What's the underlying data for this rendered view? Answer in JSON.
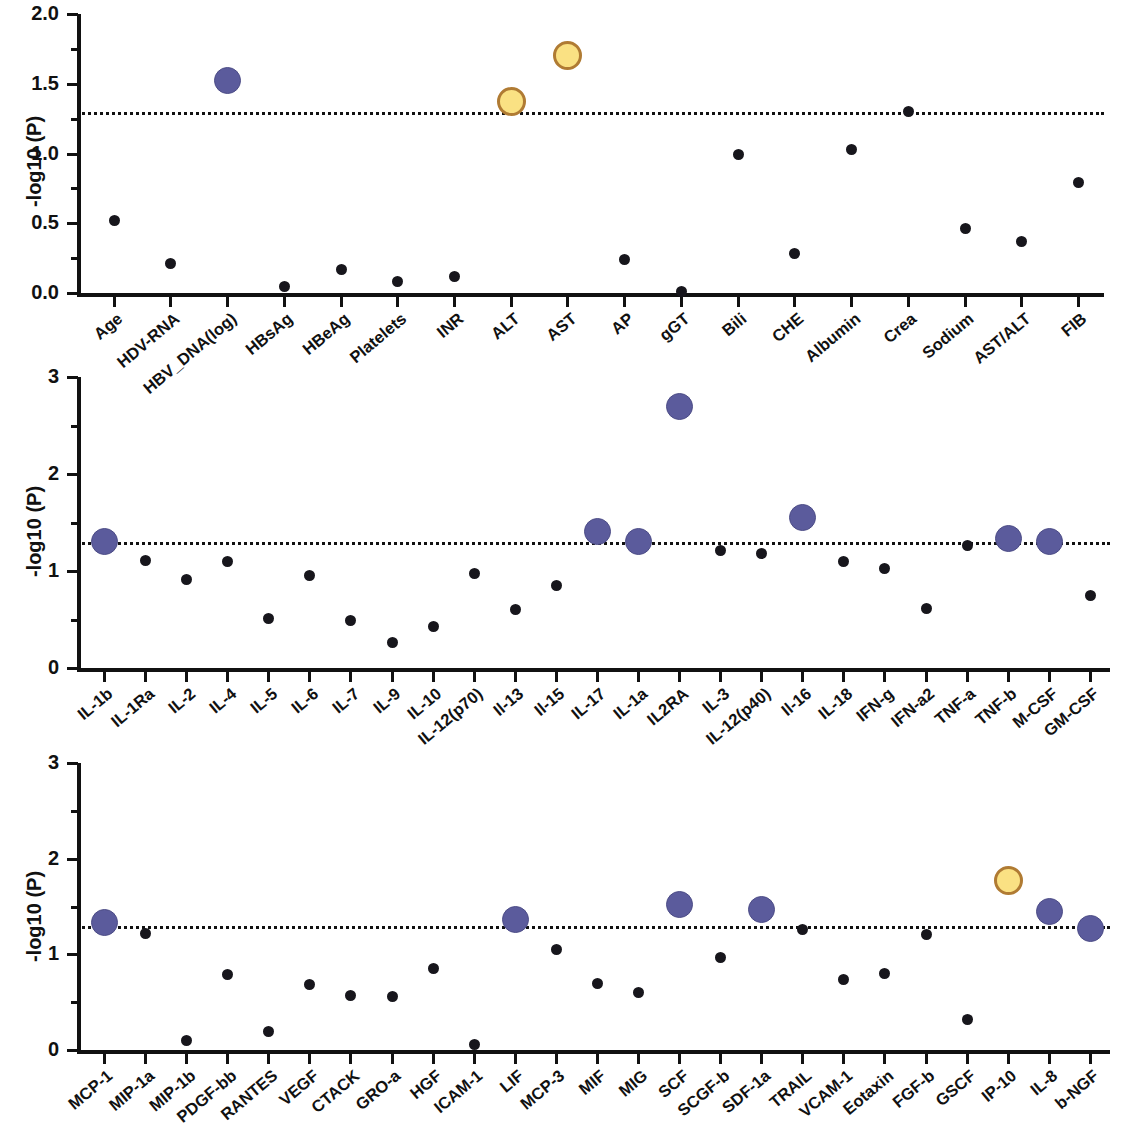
{
  "figure": {
    "y_axis_title": "-log10 (P)",
    "threshold_value": 1.3,
    "marker_colors": {
      "non_significant": "#17161c",
      "significant": "#5b5b9c",
      "highly_significant": "#fae183",
      "highly_significant_border": "#b07b33"
    }
  },
  "chart_data": [
    {
      "type": "scatter",
      "title": "",
      "xlabel": "",
      "ylabel": "-log10 (P)",
      "ylim": [
        0.0,
        2.0
      ],
      "yticks": [
        "0.0",
        "0.5",
        "1.0",
        "1.5",
        "2.0"
      ],
      "ytick_values": [
        0.0,
        0.5,
        1.0,
        1.5,
        2.0
      ],
      "grid": false,
      "legend": "none",
      "threshold": 1.3,
      "categories": [
        "Age",
        "HDV-RNA",
        "HBV_DNA(log)",
        "HBsAg",
        "HBeAg",
        "Platelets",
        "INR",
        "ALT",
        "AST",
        "AP",
        "gGT",
        "Bili",
        "CHE",
        "Albumin",
        "Crea",
        "Sodium",
        "AST/ALT",
        "FIB"
      ],
      "values": [
        0.52,
        0.21,
        1.52,
        0.05,
        0.17,
        0.08,
        0.12,
        1.37,
        1.7,
        0.24,
        0.01,
        0.99,
        0.28,
        1.03,
        1.3,
        0.46,
        0.37,
        0.79
      ],
      "marker_classes": [
        "ns",
        "ns",
        "sig",
        "ns",
        "ns",
        "ns",
        "ns",
        "hisig",
        "hisig",
        "ns",
        "ns",
        "ns",
        "ns",
        "ns",
        "ns",
        "ns",
        "ns",
        "ns"
      ]
    },
    {
      "type": "scatter",
      "title": "",
      "xlabel": "",
      "ylabel": "-log10 (P)",
      "ylim": [
        0,
        3
      ],
      "yticks": [
        "0",
        "1",
        "2",
        "3"
      ],
      "ytick_values": [
        0,
        1,
        2,
        3
      ],
      "grid": false,
      "legend": "none",
      "threshold": 1.3,
      "categories": [
        "IL-1b",
        "IL-1Ra",
        "IL-2",
        "IL-4",
        "IL-5",
        "IL-6",
        "IL-7",
        "IL-9",
        "IL-10",
        "IL-12(p70)",
        "Il-13",
        "Il-15",
        "IL-17",
        "IL-1a",
        "IL2RA",
        "IL-3",
        "IL-12(p40)",
        "Il-16",
        "IL-18",
        "IFN-g",
        "IFN-a2",
        "TNF-a",
        "TNF-b",
        "M-CSF",
        "GM-CSF"
      ],
      "values": [
        1.3,
        1.11,
        0.91,
        1.1,
        0.51,
        0.95,
        0.49,
        0.26,
        0.43,
        0.97,
        0.6,
        0.85,
        1.41,
        1.3,
        2.7,
        1.21,
        1.18,
        1.55,
        1.1,
        1.03,
        0.61,
        1.26,
        1.33,
        1.3,
        0.75
      ],
      "marker_classes": [
        "sig",
        "ns",
        "ns",
        "ns",
        "ns",
        "ns",
        "ns",
        "ns",
        "ns",
        "ns",
        "ns",
        "ns",
        "sig",
        "sig",
        "sig",
        "ns",
        "ns",
        "sig",
        "ns",
        "ns",
        "ns",
        "ns",
        "sig",
        "sig",
        "ns"
      ]
    },
    {
      "type": "scatter",
      "title": "",
      "xlabel": "",
      "ylabel": "-log10 (P)",
      "ylim": [
        0,
        3
      ],
      "yticks": [
        "0",
        "1",
        "2",
        "3"
      ],
      "ytick_values": [
        0,
        1,
        2,
        3
      ],
      "grid": false,
      "legend": "none",
      "threshold": 1.3,
      "categories": [
        "MCP-1",
        "MIP-1a",
        "MIP-1b",
        "PDGF-bb",
        "RANTES",
        "VEGF",
        "CTACK",
        "GRO-a",
        "HGF",
        "ICAM-1",
        "LIF",
        "MCP-3",
        "MIF",
        "MIG",
        "SCF",
        "SCGF-b",
        "SDF-1a",
        "TRAIL",
        "VCAM-1",
        "Eotaxin",
        "FGF-b",
        "GSCF",
        "IP-10",
        "IL-8",
        "b-NGF"
      ],
      "values": [
        1.33,
        1.22,
        0.1,
        0.79,
        0.19,
        0.68,
        0.57,
        0.56,
        0.85,
        0.06,
        1.36,
        1.05,
        0.7,
        0.6,
        1.52,
        0.97,
        1.47,
        1.26,
        0.74,
        0.8,
        1.21,
        0.32,
        1.77,
        1.45,
        1.27
      ],
      "marker_classes": [
        "sig",
        "ns",
        "ns",
        "ns",
        "ns",
        "ns",
        "ns",
        "ns",
        "ns",
        "ns",
        "sig",
        "ns",
        "ns",
        "ns",
        "sig",
        "ns",
        "sig",
        "ns",
        "ns",
        "ns",
        "ns",
        "ns",
        "hisig",
        "sig",
        "sig"
      ]
    }
  ]
}
